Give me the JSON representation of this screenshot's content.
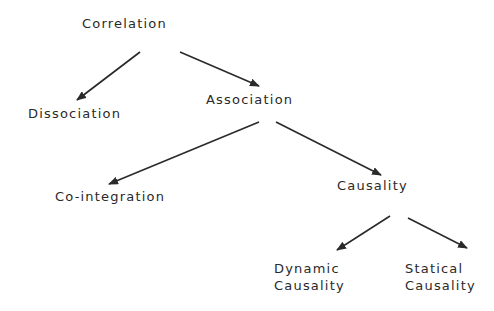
{
  "diagram": {
    "type": "tree",
    "colors": {
      "background": "#ffffff",
      "text": "#2a2a2a",
      "edge": "#2a2a2a"
    },
    "nodes": {
      "correlation": {
        "label": "Correlation"
      },
      "dissociation": {
        "label": "Dissociation"
      },
      "association": {
        "label": "Association"
      },
      "cointegration": {
        "label": "Co-integration"
      },
      "causality": {
        "label": "Causality"
      },
      "dynamic_causality": {
        "line1": "Dynamic",
        "line2": "Causality"
      },
      "statical_causality": {
        "line1": "Statical",
        "line2": "Causality"
      }
    },
    "edges": [
      {
        "from": "Correlation",
        "to": "Dissociation"
      },
      {
        "from": "Correlation",
        "to": "Association"
      },
      {
        "from": "Association",
        "to": "Co-integration"
      },
      {
        "from": "Association",
        "to": "Causality"
      },
      {
        "from": "Causality",
        "to": "Dynamic Causality"
      },
      {
        "from": "Causality",
        "to": "Statical Causality"
      }
    ]
  }
}
